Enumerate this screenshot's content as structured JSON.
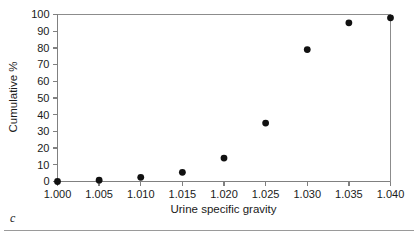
{
  "figure": {
    "panel_caption": "c"
  },
  "chart_data": {
    "type": "scatter",
    "title": "",
    "xlabel": "Urine specific gravity",
    "ylabel": "Cumulative %",
    "xlim": [
      1.0,
      1.04
    ],
    "ylim": [
      0,
      100
    ],
    "grid": false,
    "legend": "none",
    "x_ticks": [
      "1.000",
      "1.005",
      "1.010",
      "1.015",
      "1.020",
      "1.025",
      "1.030",
      "1.035",
      "1.040"
    ],
    "x_tick_values": [
      1.0,
      1.005,
      1.01,
      1.015,
      1.02,
      1.025,
      1.03,
      1.035,
      1.04
    ],
    "y_ticks": [
      "0",
      "10",
      "20",
      "30",
      "40",
      "50",
      "60",
      "70",
      "80",
      "90",
      "100"
    ],
    "y_tick_values": [
      0,
      10,
      20,
      30,
      40,
      50,
      60,
      70,
      80,
      90,
      100
    ],
    "series": [
      {
        "name": "Cumulative %",
        "marker": "filled-circle",
        "color": "#111111",
        "x": [
          1.0,
          1.005,
          1.01,
          1.015,
          1.02,
          1.025,
          1.03,
          1.035,
          1.04
        ],
        "values": [
          0,
          0.8,
          2.5,
          5.5,
          14,
          35,
          79,
          95,
          98
        ]
      }
    ]
  }
}
